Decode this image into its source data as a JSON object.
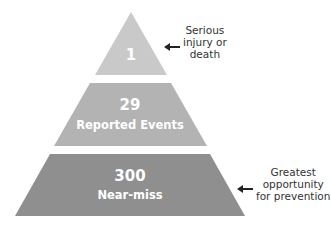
{
  "diagram": {
    "type": "pyramid",
    "tiers": [
      {
        "number": "1",
        "label": "",
        "color": "#c9c9c9",
        "annotation": [
          "Serious",
          "injury or",
          "death"
        ]
      },
      {
        "number": "29",
        "label": "Reported Events",
        "color": "#b3b3b3",
        "annotation": []
      },
      {
        "number": "300",
        "label": "Near-miss",
        "color": "#8f8f8f",
        "annotation": [
          "Greatest",
          "opportunity",
          "for prevention"
        ]
      }
    ],
    "text_color": "#ffffff",
    "annotation_text_color": "#333333",
    "arrow_color": "#222222",
    "arrow_icon": "left-arrow-icon"
  }
}
